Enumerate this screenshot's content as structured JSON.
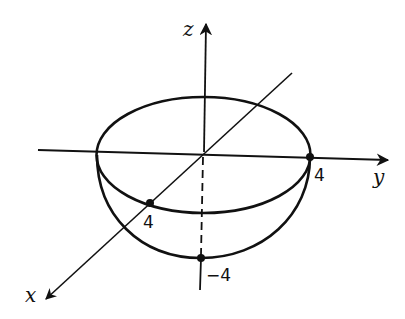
{
  "figure": {
    "axes": {
      "x": {
        "label": "x"
      },
      "y": {
        "label": "y"
      },
      "z": {
        "label": "z"
      }
    },
    "points": [
      {
        "label": "4",
        "axis": "y",
        "value": 4
      },
      {
        "label": "4",
        "axis": "x",
        "value": 4
      },
      {
        "label": "−4",
        "axis": "z",
        "value": -4
      }
    ],
    "colors": {
      "stroke": "#111111",
      "background": "#ffffff"
    }
  }
}
